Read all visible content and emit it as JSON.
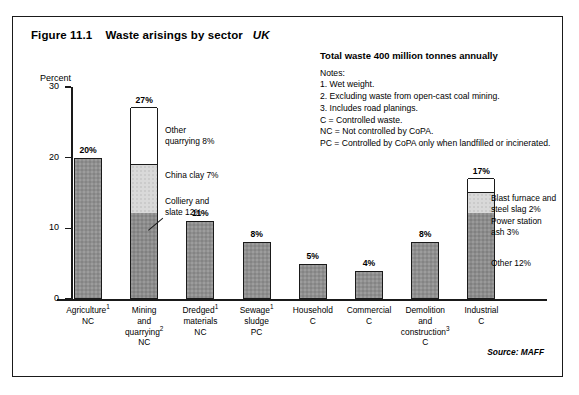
{
  "figure": {
    "label": "Figure 11.1",
    "title": "Waste arisings by sector",
    "region": "UK",
    "source": "Source: MAFF"
  },
  "notes": {
    "total": "Total waste 400 million tonnes annually",
    "heading": "Notes:",
    "items": [
      "1. Wet weight.",
      "2. Excluding waste from open-cast coal mining.",
      "3. Includes road planings.",
      "C = Controlled waste.",
      "NC = Not controlled by CoPA.",
      "PC = Controlled by CoPA only when landfilled or incinerated."
    ]
  },
  "chart_data": {
    "type": "bar",
    "subtitle": "Total waste 400 million tonnes annually",
    "xlabel": "",
    "ylabel": "Percent",
    "ylim": [
      0,
      30
    ],
    "yticks": [
      0,
      10,
      20,
      30
    ],
    "ytick_labels": [
      "0",
      "10",
      "20",
      "30"
    ],
    "grid": false,
    "legend": "none",
    "stacked": true,
    "categories": [
      "Agriculture NC",
      "Mining and quarrying NC",
      "Dredged materials NC",
      "Sewage sludge PC",
      "Household C",
      "Commercial C",
      "Demolition and construction C",
      "Industrial C"
    ],
    "values": [
      20,
      27,
      11,
      8,
      5,
      4,
      8,
      17
    ],
    "value_labels": [
      "20%",
      "27%",
      "11%",
      "8%",
      "5%",
      "4%",
      "8%",
      "17%"
    ],
    "bars": [
      {
        "category": "Agriculture NC",
        "total": 20,
        "total_label": "20%",
        "segments": [
          {
            "name": "Agriculture",
            "value": 20,
            "fill": "dark"
          }
        ]
      },
      {
        "category": "Mining and quarrying NC",
        "total": 27,
        "total_label": "27%",
        "segments": [
          {
            "name": "Colliery and slate",
            "value": 12,
            "fill": "dark"
          },
          {
            "name": "China clay",
            "value": 7,
            "fill": "light"
          },
          {
            "name": "Other quarrying",
            "value": 8,
            "fill": "white"
          }
        ]
      },
      {
        "category": "Dredged materials NC",
        "total": 11,
        "total_label": "11%",
        "segments": [
          {
            "name": "Dredged materials",
            "value": 11,
            "fill": "dark"
          }
        ]
      },
      {
        "category": "Sewage sludge PC",
        "total": 8,
        "total_label": "8%",
        "segments": [
          {
            "name": "Sewage sludge",
            "value": 8,
            "fill": "dark"
          }
        ]
      },
      {
        "category": "Household C",
        "total": 5,
        "total_label": "5%",
        "segments": [
          {
            "name": "Household",
            "value": 5,
            "fill": "dark"
          }
        ]
      },
      {
        "category": "Commercial C",
        "total": 4,
        "total_label": "4%",
        "segments": [
          {
            "name": "Commercial",
            "value": 4,
            "fill": "dark"
          }
        ]
      },
      {
        "category": "Demolition and construction C",
        "total": 8,
        "total_label": "8%",
        "segments": [
          {
            "name": "Demolition and construction",
            "value": 8,
            "fill": "dark"
          }
        ]
      },
      {
        "category": "Industrial C",
        "total": 17,
        "total_label": "17%",
        "segments": [
          {
            "name": "Other",
            "value": 12,
            "fill": "dark"
          },
          {
            "name": "Power station ash",
            "value": 3,
            "fill": "light"
          },
          {
            "name": "Blast furnace and steel slag",
            "value": 2,
            "fill": "white"
          }
        ]
      }
    ],
    "annotations": [
      {
        "id": "other-quarrying",
        "text_line1": "Other",
        "text_line2": "quarrying 8%"
      },
      {
        "id": "china-clay",
        "text_line1": "China clay 7%",
        "text_line2": ""
      },
      {
        "id": "colliery-slate",
        "text_line1": "Colliery and",
        "text_line2": "slate 12%"
      },
      {
        "id": "blast-furnace",
        "text_line1": "Blast furnace and",
        "text_line2": "steel slag 2%"
      },
      {
        "id": "power-station-ash",
        "text_line1": "Power station",
        "text_line2": "ash 3%"
      },
      {
        "id": "industrial-other",
        "text_line1": "Other 12%",
        "text_line2": ""
      }
    ]
  },
  "x_axis_labels": [
    {
      "line1": "Agriculture",
      "sup": "1",
      "line2": "NC",
      "line3": "",
      "line4": ""
    },
    {
      "line1": "Mining",
      "sup": "",
      "line2": "and",
      "line3": "quarrying 2",
      "line4": "NC"
    },
    {
      "line1": "Dredged",
      "sup": "1",
      "line2": "materials",
      "line3": "NC",
      "line4": ""
    },
    {
      "line1": "Sewage",
      "sup": "1",
      "line2": "sludge",
      "line3": "PC",
      "line4": ""
    },
    {
      "line1": "Household",
      "sup": "",
      "line2": "C",
      "line3": "",
      "line4": ""
    },
    {
      "line1": "Commercial",
      "sup": "",
      "line2": "C",
      "line3": "",
      "line4": ""
    },
    {
      "line1": "Demolition",
      "sup": "",
      "line2": "and",
      "line3": "construction 3",
      "line4": "C"
    },
    {
      "line1": "Industrial",
      "sup": "",
      "line2": "C",
      "line3": "",
      "line4": ""
    }
  ],
  "colors": {
    "dark_segment": "#8c8c8c",
    "light_segment": "#d9d9d9",
    "white_segment": "#ffffff",
    "axis": "#1a1a1a",
    "border": "#1a1a1a"
  }
}
